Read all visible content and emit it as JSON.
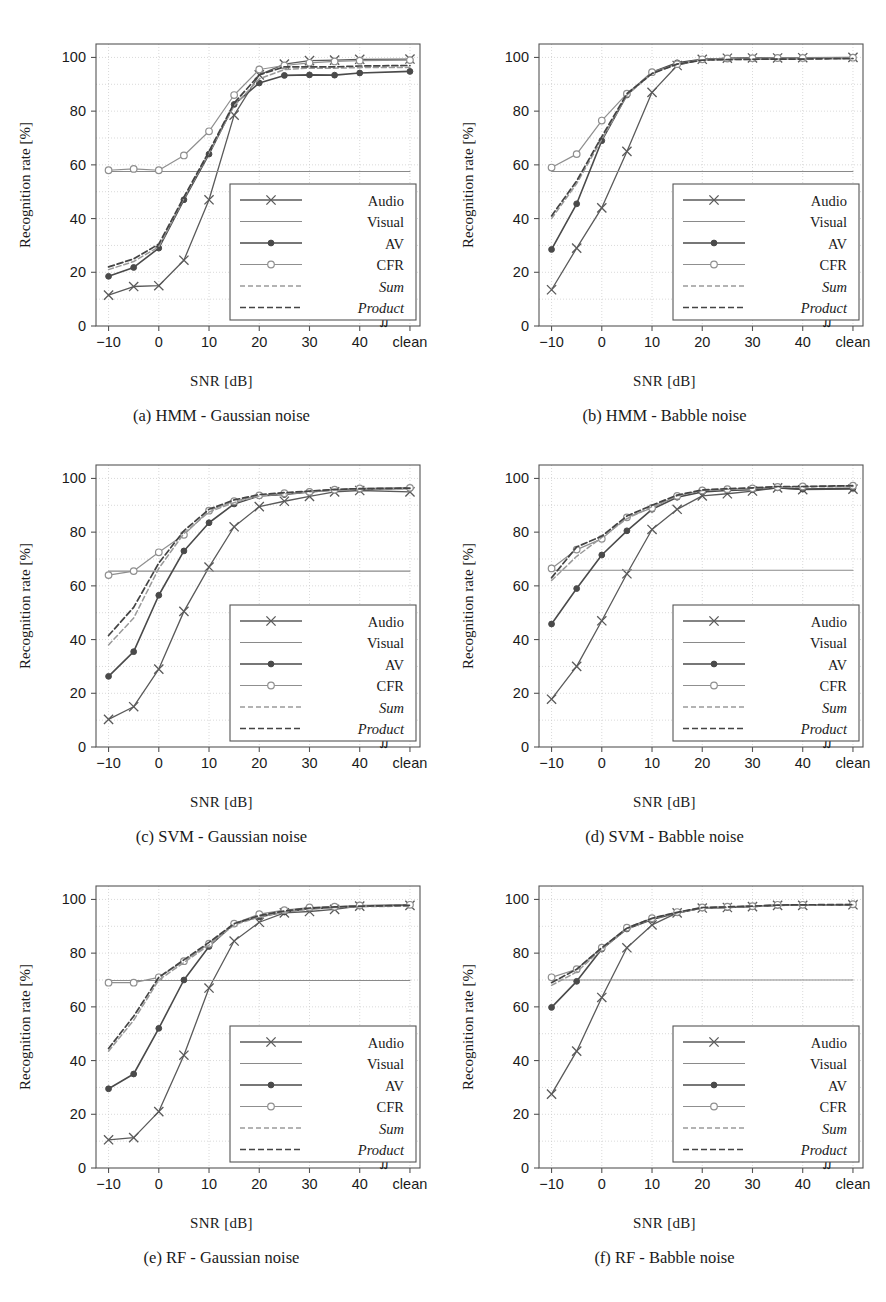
{
  "figure": {
    "axis_xlabel": "SNR [dB]",
    "axis_ylabel": "Recognition rate [%]",
    "break_symbol": "∬",
    "x_ticklabels": [
      "−10",
      "0",
      "10",
      "20",
      "30",
      "40",
      "clean"
    ],
    "y_ticklabels": [
      "0",
      "20",
      "40",
      "60",
      "80",
      "100"
    ],
    "legend_labels": [
      "Audio",
      "Visual",
      "AV",
      "CFR",
      "Sum",
      "Product"
    ],
    "colors": {
      "audio": "#5a5a5a",
      "visual": "#8a8a8a",
      "av": "#4a4a4a",
      "cfr": "#8f8f8f",
      "sum": "#9a9a9a",
      "product": "#444444",
      "grid": "#c8c8c8",
      "axis": "#555555"
    }
  },
  "chart_data": [
    {
      "id": "a",
      "type": "line",
      "title": "(a) HMM - Gaussian noise",
      "xlabel": "SNR [dB]",
      "ylabel": "Recognition rate [%]",
      "xlim": [
        -12.5,
        52
      ],
      "ylim": [
        0,
        105
      ],
      "xticks": [
        -10,
        0,
        10,
        20,
        30,
        40,
        50
      ],
      "yticks": [
        0,
        20,
        40,
        60,
        80,
        100
      ],
      "grid": true,
      "legend_position": "lower-right",
      "x": [
        -10,
        -5,
        0,
        5,
        10,
        15,
        20,
        25,
        30,
        35,
        40,
        50
      ],
      "series": [
        {
          "name": "Audio",
          "values": [
            11.5,
            14.7,
            15.0,
            24.5,
            47.0,
            78.5,
            93.5,
            97.5,
            98.8,
            99.0,
            99.3,
            99.4
          ]
        },
        {
          "name": "Visual",
          "values": [
            57.5,
            57.5,
            57.5,
            57.5,
            57.5,
            57.5,
            57.5,
            57.5,
            57.5,
            57.5,
            57.5,
            57.5
          ]
        },
        {
          "name": "AV",
          "values": [
            18.5,
            21.8,
            29.0,
            47.0,
            64.0,
            82.5,
            90.5,
            93.3,
            93.5,
            93.4,
            94.2,
            94.8
          ]
        },
        {
          "name": "CFR",
          "values": [
            58.0,
            58.5,
            58.0,
            63.5,
            72.5,
            86.0,
            95.5,
            97.0,
            98.0,
            98.5,
            98.8,
            99.0
          ]
        },
        {
          "name": "Sum",
          "values": [
            21.0,
            24.0,
            29.5,
            47.5,
            64.5,
            82.0,
            92.0,
            95.5,
            96.0,
            96.0,
            96.2,
            96.3
          ]
        },
        {
          "name": "Product",
          "values": [
            22.0,
            25.0,
            30.5,
            48.0,
            65.0,
            83.0,
            93.5,
            96.5,
            96.5,
            96.5,
            96.8,
            97.0
          ]
        }
      ]
    },
    {
      "id": "b",
      "type": "line",
      "title": "(b) HMM - Babble noise",
      "xlabel": "SNR [dB]",
      "ylabel": "Recognition rate [%]",
      "xlim": [
        -12.5,
        52
      ],
      "ylim": [
        0,
        105
      ],
      "xticks": [
        -10,
        0,
        10,
        20,
        30,
        40,
        50
      ],
      "yticks": [
        0,
        20,
        40,
        60,
        80,
        100
      ],
      "grid": true,
      "legend_position": "lower-right",
      "x": [
        -10,
        -5,
        0,
        5,
        10,
        15,
        20,
        25,
        30,
        35,
        40,
        50
      ],
      "series": [
        {
          "name": "Audio",
          "values": [
            13.5,
            29.0,
            44.0,
            65.0,
            87.0,
            97.0,
            99.3,
            99.7,
            99.8,
            99.8,
            99.9,
            100.0
          ]
        },
        {
          "name": "Visual",
          "values": [
            57.5,
            57.5,
            57.5,
            57.5,
            57.5,
            57.5,
            57.5,
            57.5,
            57.5,
            57.5,
            57.5,
            57.5
          ]
        },
        {
          "name": "AV",
          "values": [
            28.5,
            45.5,
            69.0,
            86.0,
            94.5,
            98.0,
            99.3,
            99.6,
            99.7,
            99.7,
            99.8,
            99.9
          ]
        },
        {
          "name": "CFR",
          "values": [
            59.0,
            64.0,
            76.5,
            86.5,
            94.5,
            97.5,
            99.3,
            99.6,
            99.7,
            99.8,
            99.8,
            99.9
          ]
        },
        {
          "name": "Sum",
          "values": [
            40.0,
            53.0,
            69.5,
            86.0,
            94.0,
            97.5,
            99.0,
            99.2,
            99.3,
            99.4,
            99.4,
            99.6
          ]
        },
        {
          "name": "Product",
          "values": [
            41.0,
            54.0,
            70.5,
            86.5,
            94.0,
            97.5,
            99.0,
            99.2,
            99.3,
            99.4,
            99.4,
            99.6
          ]
        }
      ]
    },
    {
      "id": "c",
      "type": "line",
      "title": "(c) SVM - Gaussian noise",
      "xlabel": "SNR [dB]",
      "ylabel": "Recognition rate [%]",
      "xlim": [
        -12.5,
        52
      ],
      "ylim": [
        0,
        105
      ],
      "xticks": [
        -10,
        0,
        10,
        20,
        30,
        40,
        50
      ],
      "yticks": [
        0,
        20,
        40,
        60,
        80,
        100
      ],
      "grid": true,
      "legend_position": "lower-right",
      "x": [
        -10,
        -5,
        0,
        5,
        10,
        15,
        20,
        25,
        30,
        35,
        40,
        50
      ],
      "series": [
        {
          "name": "Audio",
          "values": [
            10.3,
            15.0,
            29.0,
            50.5,
            67.0,
            82.0,
            89.5,
            91.5,
            93.3,
            95.0,
            95.5,
            95.0
          ]
        },
        {
          "name": "Visual",
          "values": [
            65.5,
            65.5,
            65.5,
            65.5,
            65.5,
            65.5,
            65.5,
            65.5,
            65.5,
            65.5,
            65.5,
            65.5
          ]
        },
        {
          "name": "AV",
          "values": [
            26.3,
            35.5,
            56.5,
            73.0,
            83.5,
            90.5,
            93.5,
            94.0,
            95.0,
            95.7,
            96.0,
            96.3
          ]
        },
        {
          "name": "CFR",
          "values": [
            64.0,
            65.5,
            72.5,
            79.0,
            88.0,
            91.5,
            93.7,
            94.5,
            95.0,
            95.8,
            96.3,
            96.5
          ]
        },
        {
          "name": "Sum",
          "values": [
            38.0,
            48.0,
            66.5,
            79.5,
            87.5,
            91.0,
            93.5,
            94.3,
            95.0,
            95.7,
            96.0,
            96.2
          ]
        },
        {
          "name": "Product",
          "values": [
            41.5,
            52.0,
            68.5,
            80.5,
            88.5,
            92.0,
            94.0,
            94.7,
            95.3,
            95.9,
            96.2,
            96.4
          ]
        }
      ]
    },
    {
      "id": "d",
      "type": "line",
      "title": "(d) SVM - Babble noise",
      "xlabel": "SNR [dB]",
      "ylabel": "Recognition rate [%]",
      "xlim": [
        -12.5,
        52
      ],
      "ylim": [
        0,
        105
      ],
      "xticks": [
        -10,
        0,
        10,
        20,
        30,
        40,
        50
      ],
      "yticks": [
        0,
        20,
        40,
        60,
        80,
        100
      ],
      "grid": true,
      "legend_position": "lower-right",
      "x": [
        -10,
        -5,
        0,
        5,
        10,
        15,
        20,
        25,
        30,
        35,
        40,
        50
      ],
      "series": [
        {
          "name": "Audio",
          "values": [
            17.8,
            30.0,
            47.0,
            64.5,
            81.0,
            88.5,
            93.5,
            94.3,
            95.3,
            96.5,
            95.8,
            96.0
          ]
        },
        {
          "name": "Visual",
          "values": [
            65.8,
            65.8,
            65.8,
            65.8,
            65.8,
            65.8,
            65.8,
            65.8,
            65.8,
            65.8,
            65.8,
            65.8
          ]
        },
        {
          "name": "AV",
          "values": [
            45.8,
            59.0,
            71.5,
            80.5,
            88.5,
            93.0,
            95.0,
            95.5,
            95.8,
            96.5,
            96.0,
            96.3
          ]
        },
        {
          "name": "CFR",
          "values": [
            66.5,
            73.5,
            77.5,
            85.5,
            89.0,
            93.5,
            95.5,
            96.0,
            96.3,
            96.8,
            97.0,
            97.3
          ]
        },
        {
          "name": "Sum",
          "values": [
            62.0,
            71.0,
            78.0,
            85.0,
            89.5,
            93.5,
            95.5,
            96.0,
            96.3,
            96.8,
            96.8,
            97.0
          ]
        },
        {
          "name": "Product",
          "values": [
            63.0,
            74.5,
            78.5,
            86.0,
            90.0,
            93.8,
            95.7,
            96.2,
            96.5,
            97.0,
            97.0,
            97.3
          ]
        }
      ]
    },
    {
      "id": "e",
      "type": "line",
      "title": "(e) RF - Gaussian noise",
      "xlabel": "SNR [dB]",
      "ylabel": "Recognition rate [%]",
      "xlim": [
        -12.5,
        52
      ],
      "ylim": [
        0,
        105
      ],
      "xticks": [
        -10,
        0,
        10,
        20,
        30,
        40,
        50
      ],
      "yticks": [
        0,
        20,
        40,
        60,
        80,
        100
      ],
      "grid": true,
      "legend_position": "lower-right",
      "x": [
        -10,
        -5,
        0,
        5,
        10,
        15,
        20,
        25,
        30,
        35,
        40,
        50
      ],
      "series": [
        {
          "name": "Audio",
          "values": [
            10.5,
            11.3,
            21.0,
            42.0,
            67.0,
            84.5,
            91.5,
            95.0,
            95.5,
            96.3,
            97.5,
            97.8
          ]
        },
        {
          "name": "Visual",
          "values": [
            69.8,
            69.8,
            69.8,
            69.8,
            69.8,
            69.8,
            69.8,
            69.8,
            69.8,
            69.8,
            69.8,
            69.8
          ]
        },
        {
          "name": "AV",
          "values": [
            29.5,
            35.0,
            52.0,
            70.0,
            82.5,
            91.0,
            93.5,
            95.3,
            96.5,
            97.0,
            97.5,
            98.0
          ]
        },
        {
          "name": "CFR",
          "values": [
            69.0,
            69.0,
            71.0,
            77.0,
            83.5,
            91.0,
            94.5,
            96.0,
            97.0,
            97.3,
            97.8,
            98.0
          ]
        },
        {
          "name": "Sum",
          "values": [
            43.5,
            55.0,
            70.0,
            76.5,
            83.0,
            90.5,
            93.5,
            95.3,
            96.5,
            97.0,
            97.3,
            97.5
          ]
        },
        {
          "name": "Product",
          "values": [
            44.5,
            56.5,
            71.0,
            77.5,
            84.0,
            91.0,
            94.0,
            95.7,
            96.8,
            97.2,
            97.5,
            97.8
          ]
        }
      ]
    },
    {
      "id": "f",
      "type": "line",
      "title": "(f) RF - Babble noise",
      "xlabel": "SNR [dB]",
      "ylabel": "Recognition rate [%]",
      "xlim": [
        -12.5,
        52
      ],
      "ylim": [
        0,
        105
      ],
      "xticks": [
        -10,
        0,
        10,
        20,
        30,
        40,
        50
      ],
      "yticks": [
        0,
        20,
        40,
        60,
        80,
        100
      ],
      "grid": true,
      "legend_position": "lower-right",
      "x": [
        -10,
        -5,
        0,
        5,
        10,
        15,
        20,
        25,
        30,
        35,
        40,
        50
      ],
      "series": [
        {
          "name": "Audio",
          "values": [
            27.5,
            43.5,
            63.5,
            82.0,
            90.5,
            95.0,
            96.8,
            97.0,
            97.3,
            97.8,
            97.8,
            98.0
          ]
        },
        {
          "name": "Visual",
          "values": [
            70.0,
            70.0,
            70.0,
            70.0,
            70.0,
            70.0,
            70.0,
            70.0,
            70.0,
            70.0,
            70.0,
            70.0
          ]
        },
        {
          "name": "AV",
          "values": [
            59.8,
            69.5,
            81.5,
            89.0,
            92.5,
            95.0,
            96.8,
            97.0,
            97.5,
            97.8,
            98.0,
            98.0
          ]
        },
        {
          "name": "CFR",
          "values": [
            71.0,
            74.0,
            82.0,
            89.5,
            93.0,
            95.3,
            97.0,
            97.3,
            97.5,
            98.0,
            98.0,
            98.2
          ]
        },
        {
          "name": "Sum",
          "values": [
            68.0,
            73.0,
            81.5,
            89.0,
            92.8,
            95.0,
            96.8,
            97.0,
            97.3,
            97.8,
            97.8,
            98.0
          ]
        },
        {
          "name": "Product",
          "values": [
            69.0,
            74.0,
            82.0,
            89.3,
            93.0,
            95.2,
            97.0,
            97.2,
            97.5,
            97.9,
            98.0,
            98.1
          ]
        }
      ]
    }
  ]
}
